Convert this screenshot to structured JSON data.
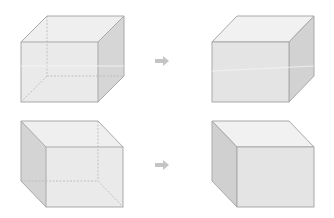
{
  "diagram": {
    "colors": {
      "background": "#ffffff",
      "edge": "#a9a9a9",
      "hidden_edge": "#b8b8b8",
      "face_front": "#e6e6e6",
      "face_top": "#efefef",
      "face_side": "#d2d2d2",
      "arrow": "#c4c4c4"
    },
    "rows": [
      {
        "source": {
          "name": "transparent-cube-right-view",
          "front": [
            21,
            42,
            77,
            60
          ],
          "offset": [
            26,
            -26
          ]
        },
        "arrow": {
          "x": 155,
          "y": 61
        },
        "result": {
          "name": "solid-cube-right-view",
          "front": [
            212,
            42,
            77,
            60
          ],
          "offset": [
            25,
            -26
          ]
        }
      },
      {
        "source": {
          "name": "transparent-cube-left-view",
          "front": [
            46,
            147,
            77,
            60
          ],
          "offset": [
            -25,
            -26
          ]
        },
        "arrow": {
          "x": 155,
          "y": 165
        },
        "result": {
          "name": "solid-cube-left-view",
          "front": [
            237,
            147,
            77,
            60
          ],
          "offset": [
            -25,
            -26
          ]
        }
      }
    ]
  }
}
